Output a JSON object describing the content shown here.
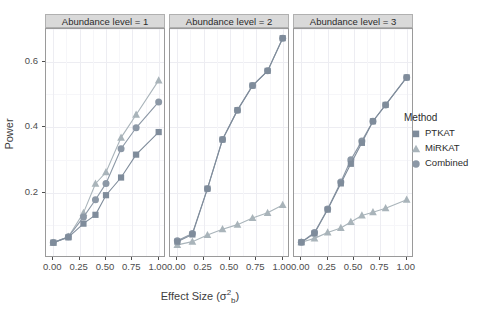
{
  "chart_data": {
    "type": "line",
    "title": "",
    "xlabel": "Effect Size (σ²b)",
    "ylabel": "Power",
    "xlim": [
      -0.06,
      1.06
    ],
    "ylim": [
      0.0,
      0.7
    ],
    "xticks": [
      "0.00",
      "0.25",
      "0.50",
      "0.75",
      "1.00"
    ],
    "xtick_values": [
      0.0,
      0.25,
      0.5,
      0.75,
      1.0
    ],
    "yticks": [
      "0.2",
      "0.4",
      "0.6"
    ],
    "ytick_values": [
      0.2,
      0.4,
      0.6
    ],
    "grid": true,
    "legend_position": "right",
    "facet_variable": "Abundance level",
    "x": [
      0.0,
      0.083,
      0.167,
      0.25,
      0.333,
      0.417,
      0.5,
      0.583,
      0.667,
      0.75,
      0.833,
      0.917,
      1.0
    ],
    "panels": [
      {
        "label": "Abundance level = 1",
        "series": [
          {
            "name": "PTKAT",
            "values": [
              0.047,
              0.063,
              0.105,
              0.132,
              0.192,
              0.246,
              0.316,
              0.385
            ]
          },
          {
            "name": "MiRKAT",
            "values": [
              0.047,
              0.065,
              0.138,
              0.227,
              0.262,
              0.368,
              0.438,
              0.543
            ]
          },
          {
            "name": "Combined",
            "values": [
              0.047,
              0.065,
              0.125,
              0.178,
              0.228,
              0.334,
              0.398,
              0.477
            ]
          }
        ],
        "series_x": [
          0.0,
          0.143,
          0.286,
          0.4,
          0.5,
          0.643,
          0.786,
          1.0
        ]
      },
      {
        "label": "Abundance level = 2",
        "series": [
          {
            "name": "PTKAT",
            "values": [
              0.05,
              0.072,
              0.212,
              0.362,
              0.452,
              0.527,
              0.572,
              0.672
            ]
          },
          {
            "name": "MiRKAT",
            "values": [
              0.04,
              0.05,
              0.07,
              0.088,
              0.102,
              0.122,
              0.138,
              0.162
            ]
          },
          {
            "name": "Combined",
            "values": [
              0.053,
              0.075,
              0.212,
              0.362,
              0.452,
              0.527,
              0.572,
              0.672
            ]
          }
        ],
        "series_x": [
          0.0,
          0.143,
          0.286,
          0.429,
          0.571,
          0.714,
          0.857,
          1.0
        ]
      },
      {
        "label": "Abundance level = 3",
        "series": [
          {
            "name": "PTKAT",
            "values": [
              0.048,
              0.075,
              0.148,
              0.228,
              0.288,
              0.352,
              0.418,
              0.468,
              0.552
            ]
          },
          {
            "name": "MiRKAT",
            "values": [
              0.048,
              0.06,
              0.078,
              0.092,
              0.11,
              0.13,
              0.14,
              0.152,
              0.178
            ]
          },
          {
            "name": "Combined",
            "values": [
              0.048,
              0.078,
              0.15,
              0.232,
              0.3,
              0.358,
              0.418,
              0.468,
              0.552
            ]
          }
        ],
        "series_x": [
          0.0,
          0.125,
          0.25,
          0.375,
          0.47,
          0.575,
          0.68,
          0.8,
          1.0
        ]
      }
    ],
    "legend": {
      "title": "Method",
      "entries": [
        {
          "label": "PTKAT",
          "marker": "square",
          "color": "#7f8c9b"
        },
        {
          "label": "MiRKAT",
          "marker": "triangle",
          "color": "#a9b4ba"
        },
        {
          "label": "Combined",
          "marker": "circle",
          "color": "#8c98a6"
        }
      ]
    },
    "colors": {
      "ptkat": "#7f8c9b",
      "mirkat": "#a9b4ba",
      "combined": "#8c98a6",
      "strip_bg": "#d9d9d9",
      "panel_border": "#9a9a9a",
      "grid_major": "#ededf2",
      "grid_minor": "#f6f6f9",
      "axis_text": "#4d4d4d"
    }
  }
}
